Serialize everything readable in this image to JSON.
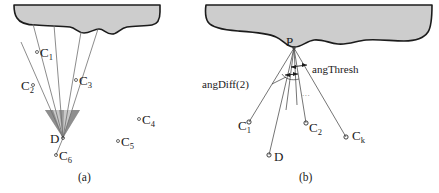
{
  "figure": {
    "background_color": "#ffffff",
    "blob_fill": "#cdcdcd",
    "blob_stroke": "#1c1c1c",
    "ray_color": "#6f6f6f",
    "text_color": "#1a1a1a",
    "cone_light_fill": "#c9c9c9",
    "cone_dark_fill": "#8e8e8e"
  },
  "panel_a": {
    "caption": "(a)",
    "labels": [
      {
        "name": "c1",
        "text": "C",
        "sub": "1"
      },
      {
        "name": "c2",
        "text": "C",
        "sub": "2"
      },
      {
        "name": "c3",
        "text": "C",
        "sub": "3"
      },
      {
        "name": "c4",
        "text": "C",
        "sub": "4"
      },
      {
        "name": "c5",
        "text": "C",
        "sub": "5"
      },
      {
        "name": "c6",
        "text": "C",
        "sub": "6"
      },
      {
        "name": "d",
        "text": "D",
        "sub": ""
      }
    ]
  },
  "panel_b": {
    "caption": "(b)",
    "labels": [
      {
        "name": "p",
        "text": "P",
        "sub": ""
      },
      {
        "name": "c1",
        "text": "C",
        "sub": "1"
      },
      {
        "name": "c2",
        "text": "C",
        "sub": "2"
      },
      {
        "name": "ck",
        "text": "C",
        "sub": "k"
      },
      {
        "name": "d",
        "text": "D",
        "sub": ""
      }
    ],
    "annotations": {
      "ang_diff": "angDiff(2)",
      "ang_thresh": "angThresh",
      "ellipsis": "..."
    }
  }
}
